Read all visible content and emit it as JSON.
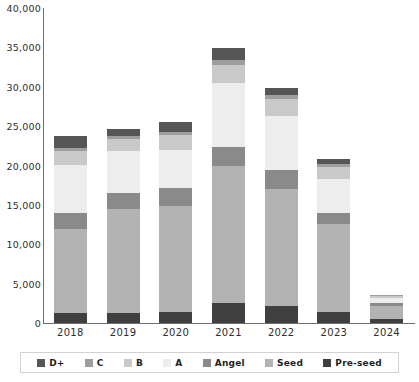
{
  "chart_data": {
    "type": "bar",
    "subtype": "stacked-bar",
    "title": "",
    "xlabel": "",
    "ylabel": "",
    "ylim": [
      0,
      40000
    ],
    "ytick_labels": [
      "0",
      "5,000",
      "10,000",
      "15,000",
      "20,000",
      "25,000",
      "30,000",
      "35,000",
      "40,000"
    ],
    "ytick_values": [
      0,
      5000,
      10000,
      15000,
      20000,
      25000,
      30000,
      35000,
      40000
    ],
    "grid": false,
    "legend_position": "bottom",
    "categories": [
      "2018",
      "2019",
      "2020",
      "2021",
      "2022",
      "2023",
      "2024"
    ],
    "stack_order_bottom_to_top": [
      "Pre-seed",
      "Seed",
      "Angel",
      "A",
      "B",
      "C",
      "D+"
    ],
    "series": [
      {
        "name": "Pre-seed",
        "color": "#3f3f3f",
        "values": [
          1300,
          1300,
          1400,
          2500,
          2200,
          1400,
          500
        ]
      },
      {
        "name": "Seed",
        "color": "#b3b3b3",
        "values": [
          10700,
          13200,
          13500,
          17400,
          14800,
          11200,
          1600
        ]
      },
      {
        "name": "Angel",
        "color": "#8a8a8a",
        "values": [
          2000,
          2000,
          2200,
          2500,
          2400,
          1400,
          400
        ]
      },
      {
        "name": "A",
        "color": "#ededed",
        "values": [
          6100,
          5300,
          4900,
          8100,
          6900,
          4300,
          700
        ]
      },
      {
        "name": "B",
        "color": "#c9c9c9",
        "values": [
          1800,
          1600,
          1900,
          2300,
          2100,
          1500,
          200
        ]
      },
      {
        "name": "C",
        "color": "#9e9e9e",
        "values": [
          300,
          300,
          400,
          600,
          500,
          400,
          100
        ]
      },
      {
        "name": "D+",
        "color": "#565656",
        "values": [
          1600,
          1000,
          1200,
          1500,
          900,
          600,
          100
        ]
      }
    ],
    "totals": [
      23800,
      24700,
      25500,
      34900,
      29800,
      20800,
      3600
    ]
  },
  "legend": {
    "items": [
      {
        "label": "D+",
        "color": "#565656",
        "icon": "legend-swatch-icon"
      },
      {
        "label": "C",
        "color": "#9e9e9e",
        "icon": "legend-swatch-icon"
      },
      {
        "label": "B",
        "color": "#c9c9c9",
        "icon": "legend-swatch-icon"
      },
      {
        "label": "A",
        "color": "#ededed",
        "icon": "legend-swatch-icon"
      },
      {
        "label": "Angel",
        "color": "#8a8a8a",
        "icon": "legend-swatch-icon"
      },
      {
        "label": "Seed",
        "color": "#b3b3b3",
        "icon": "legend-swatch-icon"
      },
      {
        "label": "Pre-seed",
        "color": "#3f3f3f",
        "icon": "legend-swatch-icon"
      }
    ]
  },
  "axis": {
    "line_color": "#6f6f6f",
    "label_color": "#2e2e2e"
  }
}
